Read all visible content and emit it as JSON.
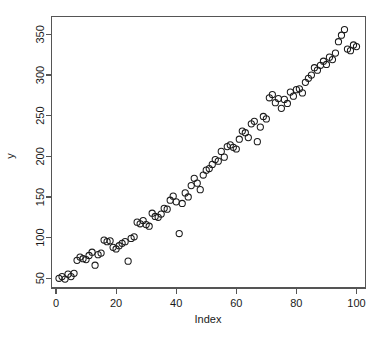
{
  "chart_data": {
    "type": "scatter",
    "title": "",
    "xlabel": "Index",
    "ylabel": "y",
    "xlim": [
      -1.5,
      103
    ],
    "ylim": [
      38,
      372
    ],
    "grid": false,
    "legend": false,
    "point_symbol": "open-circle",
    "point_color": "#1a1a1a",
    "x_ticks": [
      0,
      20,
      40,
      60,
      80,
      100
    ],
    "y_ticks": [
      50,
      100,
      150,
      200,
      250,
      300,
      350
    ],
    "x_tick_labels": [
      "0",
      "20",
      "40",
      "60",
      "80",
      "100"
    ],
    "y_tick_labels": [
      "50",
      "100",
      "150",
      "200",
      "250",
      "300",
      "350"
    ],
    "x": [
      1,
      2,
      3,
      4,
      5,
      6,
      7,
      8,
      9,
      10,
      11,
      12,
      13,
      14,
      15,
      16,
      17,
      18,
      19,
      20,
      21,
      22,
      23,
      24,
      25,
      26,
      27,
      28,
      29,
      30,
      31,
      32,
      33,
      34,
      35,
      36,
      37,
      38,
      39,
      40,
      41,
      42,
      43,
      44,
      45,
      46,
      47,
      48,
      49,
      50,
      51,
      52,
      53,
      54,
      55,
      56,
      57,
      58,
      59,
      60,
      61,
      62,
      63,
      64,
      65,
      66,
      67,
      68,
      69,
      70,
      71,
      72,
      73,
      74,
      75,
      76,
      77,
      78,
      79,
      80,
      81,
      82,
      83,
      84,
      85,
      86,
      87,
      88,
      89,
      90,
      91,
      92,
      93,
      94,
      95,
      96,
      97,
      98,
      99,
      100
    ],
    "values": [
      50,
      52,
      49,
      55,
      52,
      56,
      72,
      76,
      74,
      73,
      78,
      82,
      66,
      79,
      81,
      97,
      95,
      96,
      88,
      86,
      90,
      93,
      95,
      71,
      99,
      101,
      119,
      117,
      121,
      116,
      114,
      130,
      126,
      125,
      129,
      136,
      135,
      146,
      151,
      144,
      105,
      142,
      155,
      150,
      164,
      173,
      167,
      159,
      177,
      183,
      185,
      190,
      196,
      194,
      206,
      199,
      212,
      214,
      211,
      209,
      221,
      231,
      229,
      223,
      240,
      243,
      218,
      236,
      249,
      246,
      272,
      276,
      266,
      271,
      259,
      270,
      265,
      279,
      274,
      282,
      283,
      278,
      291,
      296,
      300,
      309,
      306,
      312,
      317,
      313,
      322,
      319,
      327,
      341,
      349,
      356,
      332,
      330,
      337,
      335
    ],
    "note": "Simulated y increasing roughly linearly with Index plus noise"
  },
  "axes": {
    "x_title": "Index",
    "y_title": "y"
  }
}
